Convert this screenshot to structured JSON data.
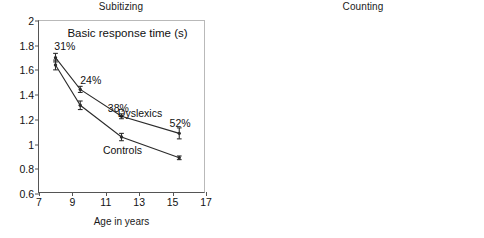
{
  "figure": {
    "width": 484,
    "height": 238,
    "background": "#ffffff",
    "line_color": "#2b2b2b"
  },
  "panels": [
    {
      "key": "subitizing",
      "title": "Subitizing",
      "inner_title": "Basic response time (s)",
      "xlabel": "Age in years",
      "ylabel": "",
      "xlim": [
        7,
        17
      ],
      "ylim": [
        0.6,
        2
      ],
      "xticks": [
        7,
        9,
        11,
        13,
        15,
        17
      ],
      "yticks": [
        0.6,
        0.8,
        1,
        1.2,
        1.4,
        1.6,
        1.8,
        2
      ],
      "xticklabels": [
        "7",
        "9",
        "11",
        "13",
        "15",
        "17"
      ],
      "yticklabels": [
        "0.6",
        "0.8",
        "1",
        "1.2",
        "1.4",
        "1.6",
        "1.8",
        "2"
      ],
      "series_labels": [
        {
          "text": "Dyslexics",
          "x": 13.05,
          "y": 1.255
        },
        {
          "text": "Controls",
          "x": 12.0,
          "y": 0.955
        }
      ],
      "annotations": [
        {
          "text": "31%",
          "x": 8.55,
          "y": 1.795
        },
        {
          "text": "24%",
          "x": 10.1,
          "y": 1.525
        },
        {
          "text": "38%",
          "x": 11.75,
          "y": 1.295
        },
        {
          "text": "52%",
          "x": 15.45,
          "y": 1.175
        }
      ]
    },
    {
      "key": "counting",
      "title": "Counting",
      "inner_title": "Effect. recognition (1/s)",
      "xlabel": "Age in years",
      "ylabel": "",
      "xlim": [
        7,
        17
      ],
      "ylim": [
        0.6,
        3.3
      ],
      "xticks": [
        7,
        9,
        11,
        13,
        15,
        17
      ],
      "yticks": [
        0.6,
        0.9,
        1.2,
        1.5,
        1.8,
        2.1,
        2.4,
        2.7,
        3,
        3.3
      ],
      "xticklabels": [
        "7",
        "9",
        "11",
        "13",
        "15",
        "17"
      ],
      "yticklabels": [
        "0.6",
        "0.9",
        "1.2",
        "1.5",
        "1.8",
        "2.1",
        "2.4",
        "2.7",
        "3",
        "3.3"
      ],
      "series_labels": [
        {
          "text": "Controls",
          "x": 11.35,
          "y": 2.63
        },
        {
          "text": "Dyslexics",
          "x": 11.55,
          "y": 1.33
        }
      ],
      "annotations": [
        {
          "text": "43%",
          "x": 8.6,
          "y": 0.73
        },
        {
          "text": "55%",
          "x": 10.0,
          "y": 1.08
        },
        {
          "text": "64%",
          "x": 12.85,
          "y": 1.6
        },
        {
          "text": "63%",
          "x": 14.75,
          "y": 1.97
        }
      ]
    }
  ],
  "chart_data": [
    {
      "type": "line",
      "panel": "Subitizing",
      "title": "Subitizing",
      "subtitle": "Basic response time (s)",
      "xlabel": "Age in years",
      "ylabel": "Basic response time (s)",
      "xlim": [
        7,
        17
      ],
      "ylim": [
        0.6,
        2
      ],
      "grid": false,
      "legend": "inline-labels",
      "x": [
        8,
        9.5,
        12,
        15.5
      ],
      "series": [
        {
          "name": "Dyslexics",
          "values": [
            1.7,
            1.44,
            1.22,
            1.08
          ],
          "errors": [
            0.035,
            0.025,
            0.02,
            0.045
          ],
          "point_labels": [
            "31%",
            "24%",
            "38%",
            "52%"
          ]
        },
        {
          "name": "Controls",
          "values": [
            1.64,
            1.31,
            1.05,
            0.88
          ],
          "errors": [
            0.04,
            0.035,
            0.03,
            0.015
          ],
          "point_labels": [
            "",
            "",
            "",
            ""
          ]
        }
      ]
    },
    {
      "type": "line",
      "panel": "Counting",
      "title": "Counting",
      "subtitle": "Effect. recognition (1/s)",
      "xlabel": "Age in years",
      "ylabel": "Effect. recognition (1/s)",
      "xlim": [
        7,
        17
      ],
      "ylim": [
        0.6,
        3.3
      ],
      "grid": false,
      "legend": "inline-labels",
      "x": [
        8,
        9.5,
        12,
        15.5
      ],
      "series": [
        {
          "name": "Controls",
          "values": [
            1.24,
            1.85,
            2.34,
            2.93
          ],
          "errors": [
            0.05,
            0.09,
            0.07,
            0.08
          ],
          "point_labels": [
            "",
            "",
            "",
            ""
          ]
        },
        {
          "name": "Dyslexics",
          "values": [
            0.9,
            1.27,
            1.62,
            2.28
          ],
          "errors": [
            0.025,
            0.03,
            0.025,
            0.14
          ],
          "point_labels": [
            "43%",
            "55%",
            "64%",
            "63%"
          ]
        }
      ]
    }
  ]
}
